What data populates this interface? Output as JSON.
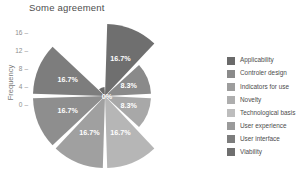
{
  "chart_data": {
    "type": "pie",
    "subtype": "polar-area-rose",
    "title": "Some agreement",
    "xlabel": "",
    "ylabel": "Frequency",
    "ylim": [
      0,
      18
    ],
    "yticks": [
      "16",
      "12",
      "8",
      "4",
      "0"
    ],
    "grid": false,
    "legend_position": "right",
    "sector_angle_deg": 45,
    "categories": [
      "Applicability",
      "Controler design",
      "Indicators for use",
      "Novelty",
      "Technological basis",
      "User experience",
      "User interface",
      "Viability"
    ],
    "values": [
      2,
      4,
      4,
      0,
      4,
      4,
      2,
      4
    ],
    "data_labels": [
      "16.7%",
      "16.7%",
      "16.7%",
      "0%",
      "8.3%",
      "16.7%",
      "16.7%",
      "8.3%"
    ],
    "slices": [
      {
        "label": "Applicability",
        "percent_label": "16.7%",
        "radius": 72,
        "start_deg": -90,
        "end_deg": -45,
        "color": "#6f6f6f"
      },
      {
        "label": "Controler design",
        "percent_label": "8.3%",
        "radius": 46,
        "start_deg": -45,
        "end_deg": 0,
        "color": "#8a8a8a"
      },
      {
        "label": "Indicators for use",
        "percent_label": "8.3%",
        "radius": 46,
        "start_deg": 0,
        "end_deg": 45,
        "color": "#a8a8a8"
      },
      {
        "label": "Novelty",
        "percent_label": "16.7%",
        "radius": 72,
        "start_deg": 45,
        "end_deg": 90,
        "color": "#b6b6b6"
      },
      {
        "label": "Technological basis",
        "percent_label": "16.7%",
        "radius": 72,
        "start_deg": 90,
        "end_deg": 135,
        "color": "#a0a0a0"
      },
      {
        "label": "User experience",
        "percent_label": "16.7%",
        "radius": 72,
        "start_deg": 135,
        "end_deg": 180,
        "color": "#8e8e8e"
      },
      {
        "label": "User interface",
        "percent_label": "16.7%",
        "radius": 72,
        "start_deg": 180,
        "end_deg": 225,
        "color": "#7d7d7d"
      },
      {
        "label": "Viability",
        "percent_label": "0%",
        "radius": 9,
        "start_deg": 225,
        "end_deg": 270,
        "color": "#6a6a6a"
      }
    ],
    "center_label": "0%"
  },
  "legend": {
    "items": [
      {
        "label": "Applicability",
        "color": "#6a6a6a"
      },
      {
        "label": "Controler design",
        "color": "#8a8a8a"
      },
      {
        "label": "Indicators for use",
        "color": "#9d9d9d"
      },
      {
        "label": "Novelty",
        "color": "#aeaeae"
      },
      {
        "label": "Technological basis",
        "color": "#bdbdbd"
      },
      {
        "label": "User experience",
        "color": "#9a9a9a"
      },
      {
        "label": "User interface",
        "color": "#7d7d7d"
      },
      {
        "label": "Viability",
        "color": "#6f6f6f"
      }
    ]
  },
  "axis": {
    "yticks": [
      {
        "value": "16",
        "top": 29
      },
      {
        "value": "12",
        "top": 47
      },
      {
        "value": "8",
        "top": 65
      },
      {
        "value": "4",
        "top": 83
      },
      {
        "value": "0",
        "top": 101
      }
    ],
    "ylabel": "Frequency"
  }
}
